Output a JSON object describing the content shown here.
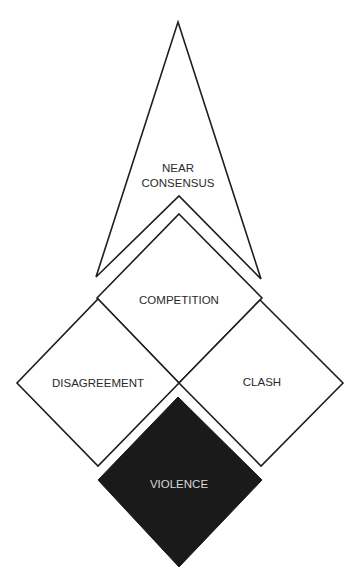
{
  "diagram": {
    "title": "",
    "colors": {
      "stroke": "#1e1e1e",
      "fill": "#ffffff",
      "violence_fill": "#1a1a1a",
      "violence_text": "#d8d8d8",
      "text": "#2a2a2a"
    },
    "shapes": {
      "near_consensus": {
        "label_line1": "NEAR",
        "label_line2": "CONSENSUS"
      },
      "competition": {
        "label": "COMPETITION"
      },
      "disagreement": {
        "label": "DISAGREEMENT"
      },
      "clash": {
        "label": "CLASH"
      },
      "violence": {
        "label": "VIOLENCE"
      }
    }
  }
}
